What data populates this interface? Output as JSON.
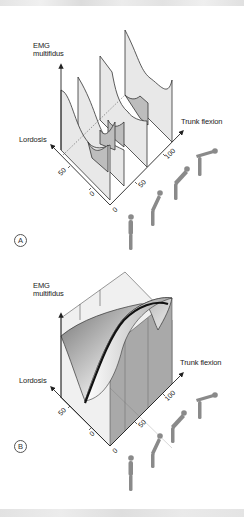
{
  "figure": {
    "panels": [
      {
        "id": "A",
        "letter": "A",
        "y_axis_label_line1": "EMG",
        "y_axis_label_line2": "multifidus",
        "left_axis_label": "Lordosis",
        "right_axis_label": "Trunk flexion",
        "trunk_ticks": [
          "0",
          "50",
          "100"
        ],
        "lordosis_ticks": [
          "0",
          "50"
        ],
        "representation": "separate curve slices at several trunk flexion levels"
      },
      {
        "id": "B",
        "letter": "B",
        "y_axis_label_line1": "EMG",
        "y_axis_label_line2": "multifidus",
        "left_axis_label": "Lordosis",
        "right_axis_label": "Trunk flexion",
        "trunk_ticks": [
          "0",
          "50",
          "100"
        ],
        "lordosis_ticks": [
          "0",
          "50"
        ],
        "representation": "continuous shaded surface with highlighted minimum path"
      }
    ],
    "figures_icon": "human-bending-sequence",
    "colors": {
      "line": "#333333",
      "fill_light": "#e6e6e6",
      "fill_dark": "#b8b8b8",
      "highlight_curve": "#111111"
    }
  }
}
